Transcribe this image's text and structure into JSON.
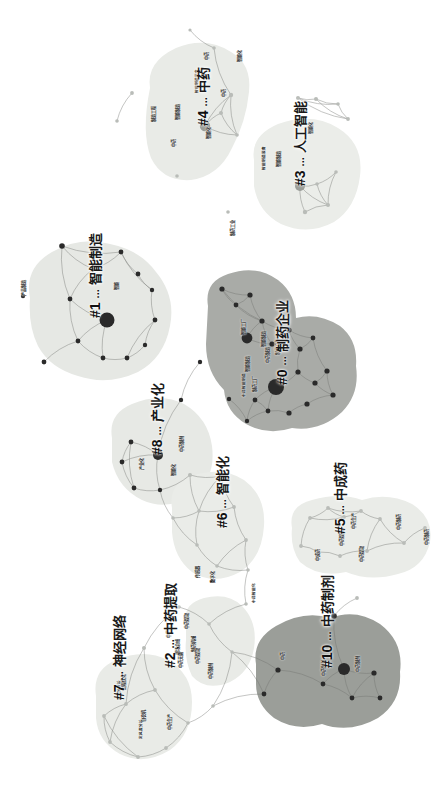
{
  "figure": {
    "type": "network-cluster-map",
    "orientation_deg": 90,
    "background": "#ffffff"
  },
  "palette": {
    "hull_light": "#e8eae6",
    "hull_mid": "#dfe2dc",
    "hull_dark": "#a8aaa6",
    "hull_darker": "#9a9d98",
    "node": "#2a2a2a",
    "node_faint": "#b9bcb8",
    "edge": "#6f726e",
    "label_text": "#1a1a1a"
  },
  "clusters": [
    {
      "id": "#0",
      "label": "制药企业",
      "x": 275,
      "y": 385,
      "hull": "dark"
    },
    {
      "id": "#1",
      "label": "智能制造",
      "x": 88,
      "y": 318,
      "hull": "light"
    },
    {
      "id": "#2",
      "label": "中药提取",
      "x": 163,
      "y": 668,
      "hull": "light"
    },
    {
      "id": "#3",
      "label": "人工智能",
      "x": 293,
      "y": 186,
      "hull": "light"
    },
    {
      "id": "#4",
      "label": "中药",
      "x": 196,
      "y": 126,
      "hull": "light"
    },
    {
      "id": "#5",
      "label": "中成药",
      "x": 333,
      "y": 534,
      "hull": "light"
    },
    {
      "id": "#6",
      "label": "智能化",
      "x": 215,
      "y": 528,
      "hull": "light"
    },
    {
      "id": "#7",
      "label": "神经网络",
      "x": 112,
      "y": 700,
      "hull": "light"
    },
    {
      "id": "#8",
      "label": "产业化",
      "x": 150,
      "y": 455,
      "hull": "light"
    },
    {
      "id": "#10",
      "label": "中药制剂",
      "x": 320,
      "y": 668,
      "hull": "darker"
    }
  ],
  "node_labels": [
    {
      "text": "智能化",
      "x": 238,
      "y": 62
    },
    {
      "text": "中药",
      "x": 205,
      "y": 60
    },
    {
      "text": "中药",
      "x": 222,
      "y": 97
    },
    {
      "text": "智能制造装备",
      "x": 196,
      "y": 93
    },
    {
      "text": "制造工程",
      "x": 152,
      "y": 122
    },
    {
      "text": "智能制造",
      "x": 176,
      "y": 120
    },
    {
      "text": "中药",
      "x": 172,
      "y": 147
    },
    {
      "text": "智能化",
      "x": 207,
      "y": 139
    },
    {
      "text": "智能制造",
      "x": 277,
      "y": 167
    },
    {
      "text": "智能制造装备",
      "x": 263,
      "y": 170
    },
    {
      "text": "智能化",
      "x": 309,
      "y": 134
    },
    {
      "text": "制药工业",
      "x": 231,
      "y": 236
    },
    {
      "text": "产品制造",
      "x": 22,
      "y": 296
    },
    {
      "text": "智能",
      "x": 115,
      "y": 290
    },
    {
      "text": "智能工厂",
      "x": 242,
      "y": 335
    },
    {
      "text": "智能制造",
      "x": 262,
      "y": 347
    },
    {
      "text": "中药制造",
      "x": 266,
      "y": 363
    },
    {
      "text": "制药设备",
      "x": 276,
      "y": 355
    },
    {
      "text": "智能制造",
      "x": 246,
      "y": 372
    },
    {
      "text": "制药工厂",
      "x": 253,
      "y": 392
    },
    {
      "text": "中药智能制造",
      "x": 243,
      "y": 397
    },
    {
      "text": "产业化",
      "x": 140,
      "y": 470
    },
    {
      "text": "中药制剂",
      "x": 180,
      "y": 452
    },
    {
      "text": "智能化",
      "x": 172,
      "y": 476
    },
    {
      "text": "传感器",
      "x": 196,
      "y": 578
    },
    {
      "text": "数字化",
      "x": 211,
      "y": 583
    },
    {
      "text": "中药智能化",
      "x": 253,
      "y": 603
    },
    {
      "text": "中成药",
      "x": 316,
      "y": 561
    },
    {
      "text": "中药提取",
      "x": 340,
      "y": 546
    },
    {
      "text": "中药生产",
      "x": 352,
      "y": 529
    },
    {
      "text": "中药制药",
      "x": 397,
      "y": 530
    },
    {
      "text": "中药提取",
      "x": 360,
      "y": 562
    },
    {
      "text": "中药制药",
      "x": 425,
      "y": 545
    },
    {
      "text": "中药加工",
      "x": 167,
      "y": 638
    },
    {
      "text": "中药提取",
      "x": 185,
      "y": 629
    },
    {
      "text": "现场总线",
      "x": 176,
      "y": 655
    },
    {
      "text": "制药机械",
      "x": 192,
      "y": 652
    },
    {
      "text": "中药无菌",
      "x": 179,
      "y": 668
    },
    {
      "text": "中药提取",
      "x": 196,
      "y": 664
    },
    {
      "text": "中药制剂",
      "x": 209,
      "y": 679
    },
    {
      "text": "包衣机",
      "x": 142,
      "y": 722
    },
    {
      "text": "过程优化",
      "x": 122,
      "y": 690
    },
    {
      "text": "主成分分析",
      "x": 118,
      "y": 700
    },
    {
      "text": "定风度分析",
      "x": 140,
      "y": 739
    },
    {
      "text": "中药生产",
      "x": 168,
      "y": 730
    },
    {
      "text": "中药制剂",
      "x": 322,
      "y": 676
    },
    {
      "text": "中药",
      "x": 281,
      "y": 660
    },
    {
      "text": "中药制剂",
      "x": 356,
      "y": 672
    }
  ],
  "nodes": [
    {
      "x": 190,
      "y": 30,
      "r": 1.6,
      "tone": "faint"
    },
    {
      "x": 214,
      "y": 48,
      "r": 1.8,
      "tone": "faint"
    },
    {
      "x": 132,
      "y": 93,
      "r": 1.9,
      "tone": "faint"
    },
    {
      "x": 117,
      "y": 121,
      "r": 1.8,
      "tone": "faint"
    },
    {
      "x": 231,
      "y": 95,
      "r": 2.2,
      "tone": "faint"
    },
    {
      "x": 221,
      "y": 113,
      "r": 2.0,
      "tone": "faint"
    },
    {
      "x": 205,
      "y": 126,
      "r": 5.2,
      "tone": "mid"
    },
    {
      "x": 177,
      "y": 176,
      "r": 1.8,
      "tone": "faint"
    },
    {
      "x": 237,
      "y": 135,
      "r": 1.8,
      "tone": "faint"
    },
    {
      "x": 298,
      "y": 98,
      "r": 2.0,
      "tone": "faint"
    },
    {
      "x": 316,
      "y": 99,
      "r": 2.0,
      "tone": "faint"
    },
    {
      "x": 338,
      "y": 104,
      "r": 1.8,
      "tone": "faint"
    },
    {
      "x": 348,
      "y": 119,
      "r": 1.9,
      "tone": "faint"
    },
    {
      "x": 300,
      "y": 186,
      "r": 5.0,
      "tone": "mid"
    },
    {
      "x": 317,
      "y": 184,
      "r": 1.8,
      "tone": "faint"
    },
    {
      "x": 336,
      "y": 172,
      "r": 1.8,
      "tone": "faint"
    },
    {
      "x": 328,
      "y": 205,
      "r": 2.0,
      "tone": "faint"
    },
    {
      "x": 305,
      "y": 212,
      "r": 2.2,
      "tone": "faint"
    },
    {
      "x": 228,
      "y": 212,
      "r": 1.8,
      "tone": "faint"
    },
    {
      "x": 62,
      "y": 246,
      "r": 2.8,
      "tone": "dark"
    },
    {
      "x": 93,
      "y": 269,
      "r": 2.4,
      "tone": "dark"
    },
    {
      "x": 121,
      "y": 252,
      "r": 2.4,
      "tone": "dark"
    },
    {
      "x": 138,
      "y": 274,
      "r": 2.4,
      "tone": "dark"
    },
    {
      "x": 152,
      "y": 290,
      "r": 2.2,
      "tone": "dark"
    },
    {
      "x": 70,
      "y": 299,
      "r": 2.4,
      "tone": "dark"
    },
    {
      "x": 23,
      "y": 296,
      "r": 2.2,
      "tone": "dark"
    },
    {
      "x": 107,
      "y": 320,
      "r": 7.5,
      "tone": "dark"
    },
    {
      "x": 155,
      "y": 320,
      "r": 2.4,
      "tone": "dark"
    },
    {
      "x": 78,
      "y": 341,
      "r": 2.4,
      "tone": "dark"
    },
    {
      "x": 103,
      "y": 358,
      "r": 2.4,
      "tone": "dark"
    },
    {
      "x": 127,
      "y": 358,
      "r": 2.4,
      "tone": "dark"
    },
    {
      "x": 145,
      "y": 345,
      "r": 2.2,
      "tone": "dark"
    },
    {
      "x": 44,
      "y": 362,
      "r": 2.4,
      "tone": "dark"
    },
    {
      "x": 222,
      "y": 289,
      "r": 2.6,
      "tone": "dark"
    },
    {
      "x": 236,
      "y": 305,
      "r": 2.4,
      "tone": "dark"
    },
    {
      "x": 250,
      "y": 295,
      "r": 2.6,
      "tone": "dark"
    },
    {
      "x": 262,
      "y": 321,
      "r": 2.6,
      "tone": "dark"
    },
    {
      "x": 247,
      "y": 338,
      "r": 5.4,
      "tone": "dark"
    },
    {
      "x": 272,
      "y": 344,
      "r": 2.6,
      "tone": "dark"
    },
    {
      "x": 289,
      "y": 330,
      "r": 2.6,
      "tone": "dark"
    },
    {
      "x": 300,
      "y": 349,
      "r": 2.6,
      "tone": "dark"
    },
    {
      "x": 313,
      "y": 338,
      "r": 2.4,
      "tone": "dark"
    },
    {
      "x": 276,
      "y": 387,
      "r": 8.0,
      "tone": "dark"
    },
    {
      "x": 298,
      "y": 372,
      "r": 2.6,
      "tone": "dark"
    },
    {
      "x": 315,
      "y": 383,
      "r": 2.6,
      "tone": "dark"
    },
    {
      "x": 327,
      "y": 371,
      "r": 2.6,
      "tone": "dark"
    },
    {
      "x": 333,
      "y": 395,
      "r": 2.6,
      "tone": "dark"
    },
    {
      "x": 307,
      "y": 404,
      "r": 2.6,
      "tone": "dark"
    },
    {
      "x": 289,
      "y": 413,
      "r": 2.6,
      "tone": "dark"
    },
    {
      "x": 268,
      "y": 411,
      "r": 2.4,
      "tone": "dark"
    },
    {
      "x": 255,
      "y": 400,
      "r": 2.4,
      "tone": "dark"
    },
    {
      "x": 247,
      "y": 421,
      "r": 2.2,
      "tone": "dark"
    },
    {
      "x": 229,
      "y": 399,
      "r": 2.2,
      "tone": "dark"
    },
    {
      "x": 200,
      "y": 362,
      "r": 2.2,
      "tone": "dark"
    },
    {
      "x": 181,
      "y": 400,
      "r": 2.2,
      "tone": "dark"
    },
    {
      "x": 158,
      "y": 455,
      "r": 5.0,
      "tone": "dark"
    },
    {
      "x": 131,
      "y": 442,
      "r": 2.4,
      "tone": "dark"
    },
    {
      "x": 122,
      "y": 462,
      "r": 2.4,
      "tone": "dark"
    },
    {
      "x": 134,
      "y": 488,
      "r": 2.4,
      "tone": "dark"
    },
    {
      "x": 160,
      "y": 490,
      "r": 2.2,
      "tone": "dark"
    },
    {
      "x": 190,
      "y": 475,
      "r": 2.0,
      "tone": "faint"
    },
    {
      "x": 221,
      "y": 476,
      "r": 2.4,
      "tone": "dark"
    },
    {
      "x": 173,
      "y": 518,
      "r": 1.8,
      "tone": "faint"
    },
    {
      "x": 199,
      "y": 511,
      "r": 1.8,
      "tone": "faint"
    },
    {
      "x": 234,
      "y": 507,
      "r": 1.9,
      "tone": "faint"
    },
    {
      "x": 246,
      "y": 540,
      "r": 1.9,
      "tone": "faint"
    },
    {
      "x": 197,
      "y": 545,
      "r": 1.8,
      "tone": "faint"
    },
    {
      "x": 217,
      "y": 566,
      "r": 1.8,
      "tone": "faint"
    },
    {
      "x": 248,
      "y": 570,
      "r": 1.8,
      "tone": "faint"
    },
    {
      "x": 310,
      "y": 518,
      "r": 1.9,
      "tone": "faint"
    },
    {
      "x": 328,
      "y": 508,
      "r": 1.9,
      "tone": "faint"
    },
    {
      "x": 344,
      "y": 517,
      "r": 1.9,
      "tone": "faint"
    },
    {
      "x": 361,
      "y": 511,
      "r": 1.9,
      "tone": "faint"
    },
    {
      "x": 380,
      "y": 519,
      "r": 1.9,
      "tone": "faint"
    },
    {
      "x": 425,
      "y": 528,
      "r": 1.9,
      "tone": "faint"
    },
    {
      "x": 404,
      "y": 543,
      "r": 1.9,
      "tone": "faint"
    },
    {
      "x": 367,
      "y": 551,
      "r": 1.9,
      "tone": "faint"
    },
    {
      "x": 340,
      "y": 556,
      "r": 1.9,
      "tone": "faint"
    },
    {
      "x": 318,
      "y": 552,
      "r": 1.9,
      "tone": "faint"
    },
    {
      "x": 301,
      "y": 546,
      "r": 1.9,
      "tone": "faint"
    },
    {
      "x": 357,
      "y": 598,
      "r": 1.9,
      "tone": "faint"
    },
    {
      "x": 246,
      "y": 604,
      "r": 1.8,
      "tone": "faint"
    },
    {
      "x": 209,
      "y": 624,
      "r": 1.8,
      "tone": "faint"
    },
    {
      "x": 179,
      "y": 607,
      "r": 1.8,
      "tone": "faint"
    },
    {
      "x": 334,
      "y": 616,
      "r": 2.8,
      "tone": "dark"
    },
    {
      "x": 344,
      "y": 669,
      "r": 6.0,
      "tone": "dark"
    },
    {
      "x": 374,
      "y": 673,
      "r": 2.6,
      "tone": "dark"
    },
    {
      "x": 380,
      "y": 698,
      "r": 2.4,
      "tone": "dark"
    },
    {
      "x": 352,
      "y": 698,
      "r": 2.4,
      "tone": "dark"
    },
    {
      "x": 323,
      "y": 684,
      "r": 2.4,
      "tone": "dark"
    },
    {
      "x": 278,
      "y": 670,
      "r": 2.6,
      "tone": "dark"
    },
    {
      "x": 264,
      "y": 694,
      "r": 2.4,
      "tone": "dark"
    },
    {
      "x": 144,
      "y": 648,
      "r": 2.0,
      "tone": "faint"
    },
    {
      "x": 155,
      "y": 690,
      "r": 1.9,
      "tone": "faint"
    },
    {
      "x": 126,
      "y": 704,
      "r": 1.9,
      "tone": "faint"
    },
    {
      "x": 104,
      "y": 716,
      "r": 1.9,
      "tone": "faint"
    },
    {
      "x": 110,
      "y": 742,
      "r": 1.9,
      "tone": "faint"
    },
    {
      "x": 138,
      "y": 757,
      "r": 1.9,
      "tone": "faint"
    },
    {
      "x": 166,
      "y": 748,
      "r": 1.9,
      "tone": "faint"
    },
    {
      "x": 188,
      "y": 723,
      "r": 1.8,
      "tone": "faint"
    },
    {
      "x": 213,
      "y": 706,
      "r": 1.8,
      "tone": "faint"
    },
    {
      "x": 232,
      "y": 652,
      "r": 1.7,
      "tone": "faint"
    }
  ]
}
